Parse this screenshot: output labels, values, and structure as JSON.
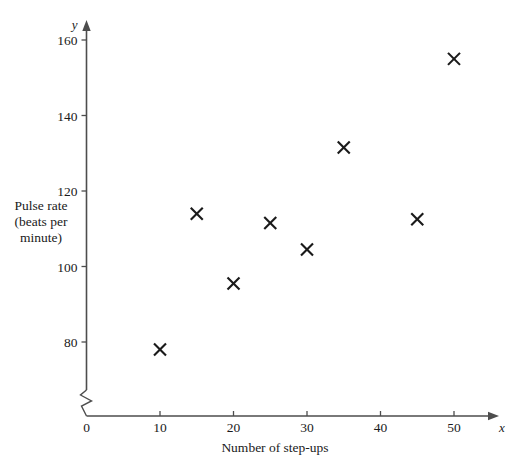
{
  "chart_data": {
    "type": "scatter",
    "title": "",
    "xlabel": "Number of step-ups",
    "ylabel": "Pulse rate (beats per minute)",
    "ylabel_lines": [
      "Pulse rate",
      "(beats per",
      "minute)"
    ],
    "x_axis_variable": "x",
    "y_axis_variable": "y",
    "xticks": [
      0,
      10,
      20,
      30,
      40,
      50
    ],
    "xtick_labels": [
      "0",
      "10",
      "20",
      "30",
      "40",
      "50"
    ],
    "yticks": [
      80,
      100,
      120,
      140,
      160
    ],
    "ytick_labels": [
      "80",
      "100",
      "120",
      "140",
      "160"
    ],
    "xlim": [
      0,
      53
    ],
    "ylim": [
      72,
      166
    ],
    "y_axis_break": true,
    "grid": false,
    "legend": "none",
    "marker": "cross",
    "marker_color": "#1a1a1a",
    "points": [
      {
        "x": 10,
        "y": 78
      },
      {
        "x": 15,
        "y": 114
      },
      {
        "x": 20,
        "y": 95.5
      },
      {
        "x": 25,
        "y": 111.5
      },
      {
        "x": 30,
        "y": 104.5
      },
      {
        "x": 35,
        "y": 131.5
      },
      {
        "x": 45,
        "y": 112.5
      },
      {
        "x": 50,
        "y": 155
      }
    ]
  }
}
